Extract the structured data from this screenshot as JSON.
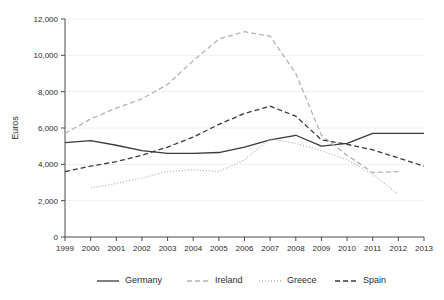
{
  "chart_data": {
    "type": "line",
    "title": "",
    "xlabel": "",
    "ylabel": "Euros",
    "x": [
      1999,
      2000,
      2001,
      2002,
      2003,
      2004,
      2005,
      2006,
      2007,
      2008,
      2009,
      2010,
      2011,
      2012,
      2013
    ],
    "xtick_labels": [
      "1999",
      "2000",
      "2001",
      "2002",
      "2003",
      "2004",
      "2005",
      "2006",
      "2007",
      "2008",
      "2009",
      "2010",
      "2011",
      "2012",
      "2013"
    ],
    "ytick_labels": [
      "0",
      "2,000",
      "4,000",
      "6,000",
      "8,000",
      "10,000",
      "12,000"
    ],
    "ytick_values": [
      0,
      2000,
      4000,
      6000,
      8000,
      10000,
      12000
    ],
    "ylim": [
      0,
      12000
    ],
    "xlim": [
      1999,
      2013
    ],
    "grid": true,
    "legend_position": "bottom",
    "series": [
      {
        "name": "Germany",
        "style": "solid",
        "color": "#3a3a3a",
        "x": [
          1999,
          2000,
          2001,
          2002,
          2003,
          2004,
          2005,
          2006,
          2007,
          2008,
          2009,
          2010,
          2011,
          2012,
          2013
        ],
        "values": [
          5200,
          5300,
          5050,
          4750,
          4600,
          4600,
          4650,
          4950,
          5350,
          5600,
          5000,
          5150,
          5700,
          5700,
          5700
        ]
      },
      {
        "name": "Ireland",
        "style": "dashed",
        "color": "#b4b4b4",
        "x": [
          1999,
          2000,
          2001,
          2002,
          2003,
          2004,
          2005,
          2006,
          2007,
          2008,
          2009,
          2010,
          2011,
          2012
        ],
        "values": [
          5700,
          6500,
          7100,
          7600,
          8400,
          9700,
          10900,
          11300,
          11050,
          9000,
          5600,
          4500,
          3550,
          3600
        ]
      },
      {
        "name": "Greece",
        "style": "dotted",
        "color": "#b4b4b4",
        "x": [
          2000,
          2001,
          2002,
          2003,
          2004,
          2005,
          2006,
          2007,
          2008,
          2009,
          2010,
          2011,
          2012
        ],
        "values": [
          2700,
          2950,
          3250,
          3600,
          3700,
          3600,
          4250,
          5400,
          5150,
          4750,
          4250,
          3450,
          2350
        ]
      },
      {
        "name": "Spain",
        "style": "dashed",
        "color": "#3a3a3a",
        "x": [
          1999,
          2000,
          2001,
          2002,
          2003,
          2004,
          2005,
          2006,
          2007,
          2008,
          2009,
          2010,
          2011,
          2012,
          2013
        ],
        "values": [
          3600,
          3900,
          4150,
          4500,
          4950,
          5500,
          6200,
          6800,
          7200,
          6650,
          5350,
          5100,
          4800,
          4350,
          3900
        ]
      }
    ]
  },
  "legend": {
    "items": [
      {
        "label": "Germany"
      },
      {
        "label": "Ireland"
      },
      {
        "label": "Greece"
      },
      {
        "label": "Spain"
      }
    ]
  }
}
